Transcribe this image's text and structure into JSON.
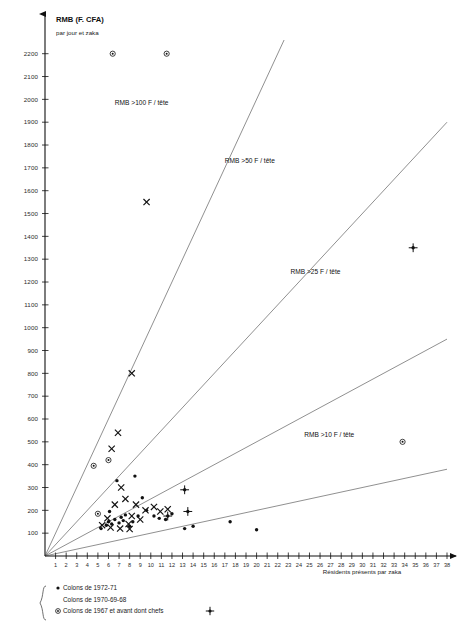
{
  "chart_data": {
    "type": "scatter",
    "title": "RMB (F. CFA)",
    "subtitle": "par jour et zaka",
    "ylabel": "RMB (F. CFA) par jour et zaka",
    "xlabel": "Résidents présents par zaka",
    "xlim": [
      0,
      38
    ],
    "ylim": [
      0,
      2260
    ],
    "grid": false,
    "legend_position": "bottom-left",
    "ytick_labels": [
      "100",
      "200",
      "300",
      "400",
      "500",
      "600",
      "700",
      "800",
      "900",
      "1000",
      "1100",
      "1200",
      "1300",
      "1400",
      "1500",
      "1600",
      "1700",
      "1800",
      "1900",
      "2000",
      "2100",
      "2200"
    ],
    "ytick_values": [
      100,
      200,
      300,
      400,
      500,
      600,
      700,
      800,
      900,
      1000,
      1100,
      1200,
      1300,
      1400,
      1500,
      1600,
      1700,
      1800,
      1900,
      2000,
      2100,
      2200
    ],
    "xtick_labels": [
      "1",
      "2",
      "3",
      "4",
      "5",
      "6",
      "7",
      "8",
      "9",
      "10",
      "11",
      "12",
      "13",
      "14",
      "15",
      "16",
      "17",
      "18",
      "19",
      "20",
      "21",
      "22",
      "23",
      "24",
      "25",
      "26",
      "27",
      "28",
      "29",
      "30",
      "31",
      "32",
      "33",
      "34",
      "35",
      "36",
      "37",
      "38"
    ],
    "xtick_values": [
      1,
      2,
      3,
      4,
      5,
      6,
      7,
      8,
      9,
      10,
      11,
      12,
      13,
      14,
      15,
      16,
      17,
      18,
      19,
      20,
      21,
      22,
      23,
      24,
      25,
      26,
      27,
      28,
      29,
      30,
      31,
      32,
      33,
      34,
      35,
      36,
      37,
      38
    ],
    "annotations": [
      {
        "text": "RMB >100 F / tête",
        "x": 6.6,
        "y": 1975
      },
      {
        "text": "RMB >50 F / tête",
        "x": 17.0,
        "y": 1720
      },
      {
        "text": "RMB >25 F / tête",
        "x": 23.2,
        "y": 1235
      },
      {
        "text": "RMB >10 F / tête",
        "x": 24.5,
        "y": 520
      }
    ],
    "reference_lines": [
      {
        "label": "RMB >100 F / tête",
        "slope": 100,
        "from": [
          0,
          0
        ],
        "to": [
          2260,
          2260
        ]
      },
      {
        "label": "RMB >50 F / tête",
        "slope": 50,
        "from": [
          0,
          0
        ],
        "to": [
          38,
          1900
        ]
      },
      {
        "label": "RMB >25 F / tête",
        "slope": 25,
        "from": [
          0,
          0
        ],
        "to": [
          38,
          950
        ]
      },
      {
        "label": "RMB >10 F / tête",
        "slope": 10,
        "from": [
          0,
          0
        ],
        "to": [
          38,
          380
        ]
      }
    ],
    "series": [
      {
        "name": "Colons de 1972-71",
        "marker": "filled-dot",
        "points": [
          [
            5.3,
            120
          ],
          [
            5.8,
            135
          ],
          [
            6.0,
            150
          ],
          [
            6.3,
            140
          ],
          [
            6.6,
            160
          ],
          [
            7.0,
            145
          ],
          [
            7.4,
            155
          ],
          [
            7.6,
            180
          ],
          [
            8.0,
            130
          ],
          [
            8.3,
            150
          ],
          [
            6.8,
            330
          ],
          [
            8.5,
            350
          ],
          [
            9.2,
            255
          ],
          [
            9.6,
            200
          ],
          [
            10.3,
            175
          ],
          [
            10.8,
            165
          ],
          [
            11.4,
            160
          ],
          [
            12.0,
            185
          ],
          [
            13.2,
            120
          ],
          [
            14.0,
            130
          ],
          [
            17.5,
            150
          ],
          [
            20.0,
            115
          ],
          [
            8.8,
            175
          ],
          [
            7.2,
            170
          ],
          [
            6.1,
            195
          ]
        ]
      },
      {
        "name": "Colons de 1970-69-68",
        "marker": "x",
        "points": [
          [
            9.6,
            1550
          ],
          [
            8.2,
            800
          ],
          [
            6.9,
            540
          ],
          [
            6.3,
            470
          ],
          [
            7.2,
            300
          ],
          [
            5.4,
            135
          ],
          [
            6.2,
            125
          ],
          [
            7.1,
            120
          ],
          [
            8.0,
            118
          ],
          [
            6.6,
            225
          ],
          [
            7.6,
            250
          ],
          [
            8.6,
            225
          ],
          [
            9.5,
            200
          ],
          [
            10.3,
            215
          ],
          [
            10.9,
            195
          ],
          [
            11.6,
            205
          ],
          [
            8.2,
            175
          ],
          [
            9.0,
            160
          ],
          [
            5.9,
            165
          ],
          [
            7.9,
            140
          ]
        ]
      },
      {
        "name": "Colons de 1967 et avant dont chefs",
        "marker": "open-circle",
        "points": [
          [
            6.4,
            2200
          ],
          [
            11.5,
            2200
          ],
          [
            4.6,
            395
          ],
          [
            6.0,
            420
          ],
          [
            33.8,
            500
          ],
          [
            5.0,
            185
          ]
        ]
      },
      {
        "name": "chefs",
        "marker": "cross-star",
        "points": [
          [
            34.8,
            1350
          ],
          [
            13.2,
            290
          ],
          [
            11.6,
            175
          ],
          [
            13.5,
            195
          ]
        ]
      }
    ]
  },
  "legend": {
    "items": [
      {
        "marker": "filled-dot",
        "label": "Colons de 1972-71"
      },
      {
        "marker": "none",
        "label": "Colons de 1970-69-68"
      },
      {
        "marker": "open-circle",
        "label": "Colons de 1967 et avant dont chefs"
      }
    ],
    "chef_marker_name": "cross-star"
  }
}
